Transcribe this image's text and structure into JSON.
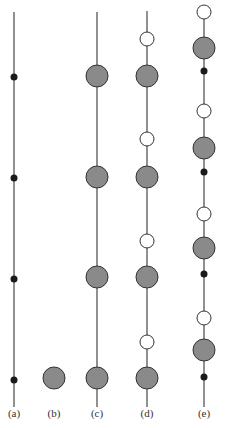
{
  "colors": {
    "line": "#555555",
    "grey_fill": "#8a8a8a",
    "outline": "#333333",
    "dot": "#1a1a1a",
    "white": "#ffffff"
  },
  "columns": [
    {
      "id": "a",
      "label": "(a)",
      "x": 14,
      "line": [
        12,
        407
      ],
      "items": [
        {
          "type": "dot",
          "y": 77
        },
        {
          "type": "dot",
          "y": 178
        },
        {
          "type": "dot",
          "y": 279
        },
        {
          "type": "dot",
          "y": 380
        }
      ]
    },
    {
      "id": "b",
      "label": "(b)",
      "x": 54,
      "line": null,
      "items": [
        {
          "type": "grey",
          "y": 378
        }
      ]
    },
    {
      "id": "c",
      "label": "(c)",
      "x": 97,
      "line": [
        12,
        407
      ],
      "items": [
        {
          "type": "grey",
          "y": 76
        },
        {
          "type": "grey",
          "y": 177
        },
        {
          "type": "grey",
          "y": 277
        },
        {
          "type": "grey",
          "y": 378
        }
      ]
    },
    {
      "id": "d",
      "label": "(d)",
      "x": 147,
      "line": [
        11,
        407
      ],
      "items": [
        {
          "type": "white",
          "y": 39
        },
        {
          "type": "grey",
          "y": 76
        },
        {
          "type": "white",
          "y": 139
        },
        {
          "type": "grey",
          "y": 177
        },
        {
          "type": "white",
          "y": 241
        },
        {
          "type": "grey",
          "y": 277
        },
        {
          "type": "white",
          "y": 342
        },
        {
          "type": "grey",
          "y": 378
        }
      ]
    },
    {
      "id": "e",
      "label": "(e)",
      "x": 204,
      "line": [
        12,
        407
      ],
      "items": [
        {
          "type": "white",
          "y": 12
        },
        {
          "type": "grey",
          "y": 48
        },
        {
          "type": "dot",
          "y": 71
        },
        {
          "type": "white",
          "y": 111
        },
        {
          "type": "grey",
          "y": 148
        },
        {
          "type": "dot",
          "y": 172
        },
        {
          "type": "white",
          "y": 214
        },
        {
          "type": "grey",
          "y": 248
        },
        {
          "type": "dot",
          "y": 274
        },
        {
          "type": "white",
          "y": 318
        },
        {
          "type": "grey",
          "y": 350
        },
        {
          "type": "dot",
          "y": 377
        }
      ]
    }
  ]
}
